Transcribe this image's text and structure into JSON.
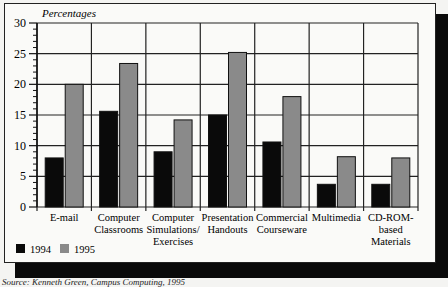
{
  "chart_data": {
    "type": "bar",
    "title": "",
    "ylabel": "Percentages",
    "xlabel": "",
    "ylim": [
      0,
      30
    ],
    "yticks": [
      0,
      5,
      10,
      15,
      20,
      25,
      30
    ],
    "grid": true,
    "legend_position": "bottom-left",
    "categories": [
      "E-mail",
      "Computer Classrooms",
      "Computer Simulations/ Exercises",
      "Presentation Handouts",
      "Commercial Courseware",
      "Multimedia",
      "CD-ROM-based Materials"
    ],
    "category_lines": [
      [
        "E-mail"
      ],
      [
        "Computer",
        "Classrooms"
      ],
      [
        "Computer",
        "Simulations/",
        "Exercises"
      ],
      [
        "Presentation",
        "Handouts"
      ],
      [
        "Commercial",
        "Courseware"
      ],
      [
        "Multimedia"
      ],
      [
        "CD-ROM-",
        "based",
        "Materials"
      ]
    ],
    "series": [
      {
        "name": "1994",
        "color": "#0a0a0a",
        "values": [
          8,
          15.6,
          9,
          15,
          10.6,
          3.7,
          3.7
        ]
      },
      {
        "name": "1995",
        "color": "#8a8a8a",
        "values": [
          20,
          23.4,
          14.2,
          25.2,
          18,
          8.2,
          8
        ]
      }
    ]
  },
  "source": "Source: Kenneth Green, Campus Computing, 1995"
}
